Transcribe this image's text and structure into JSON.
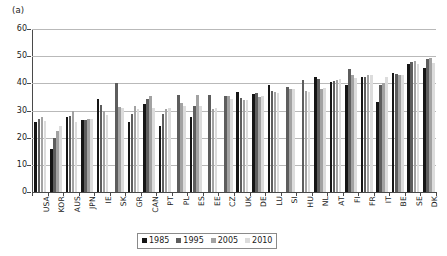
{
  "figure": {
    "panel_label": "(a)"
  },
  "chart_data": {
    "type": "bar",
    "title": "",
    "subtitle": "",
    "xlabel": "",
    "ylabel": "",
    "ylim": [
      0,
      60
    ],
    "yticks": [
      0,
      10,
      20,
      30,
      40,
      50,
      60
    ],
    "grid": "horizontal",
    "legend_position": "bottom-center",
    "categories": [
      "USA",
      "KOR",
      "AUS",
      "JPN",
      "IE",
      "SK",
      "GR",
      "CAN",
      "PT",
      "PL",
      "ES",
      "EE",
      "CZ",
      "UK",
      "DE",
      "LU",
      "SI",
      "HU",
      "NL",
      "AT",
      "FI",
      "FR",
      "IT",
      "BE",
      "SE",
      "DK"
    ],
    "series": [
      {
        "name": "1985",
        "color": "#151515",
        "values": [
          25.6,
          15.9,
          27.6,
          26.5,
          34.2,
          null,
          25.6,
          32.3,
          24.3,
          null,
          27.6,
          null,
          null,
          36.7,
          35.9,
          39.3,
          null,
          null,
          42.2,
          40.5,
          39.4,
          42.3,
          33.2,
          43.9,
          47.0,
          45.7
        ]
      },
      {
        "name": "1995",
        "color": "#5d5d5d",
        "values": [
          26.7,
          19.9,
          27.9,
          26.6,
          31.9,
          40.0,
          28.9,
          34.1,
          28.7,
          35.7,
          31.7,
          35.8,
          35.5,
          34.6,
          36.6,
          37.2,
          38.6,
          41.3,
          41.5,
          40.7,
          45.4,
          42.5,
          39.3,
          43.6,
          48.0,
          48.8
        ]
      },
      {
        "name": "2005",
        "color": "#a2a2a2",
        "values": [
          27.6,
          22.5,
          29.7,
          27.0,
          30.0,
          31.3,
          31.6,
          35.2,
          30.4,
          32.8,
          35.6,
          30.6,
          35.5,
          33.8,
          35.0,
          36.8,
          38.0,
          37.1,
          38.1,
          41.2,
          43.2,
          43.0,
          40.1,
          43.2,
          48.2,
          49.5
        ]
      },
      {
        "name": "2010",
        "color": "#dcdcdc",
        "values": [
          26.0,
          24.2,
          25.6,
          26.9,
          28.4,
          30.9,
          30.4,
          31.0,
          30.8,
          31.7,
          31.7,
          31.0,
          34.2,
          34.0,
          35.2,
          36.6,
          37.8,
          36.8,
          38.2,
          41.6,
          42.0,
          42.9,
          42.4,
          43.0,
          47.3,
          47.6
        ]
      }
    ]
  },
  "legend": {
    "items": [
      {
        "label": "1985"
      },
      {
        "label": "1995"
      },
      {
        "label": "2005"
      },
      {
        "label": "2010"
      }
    ]
  }
}
